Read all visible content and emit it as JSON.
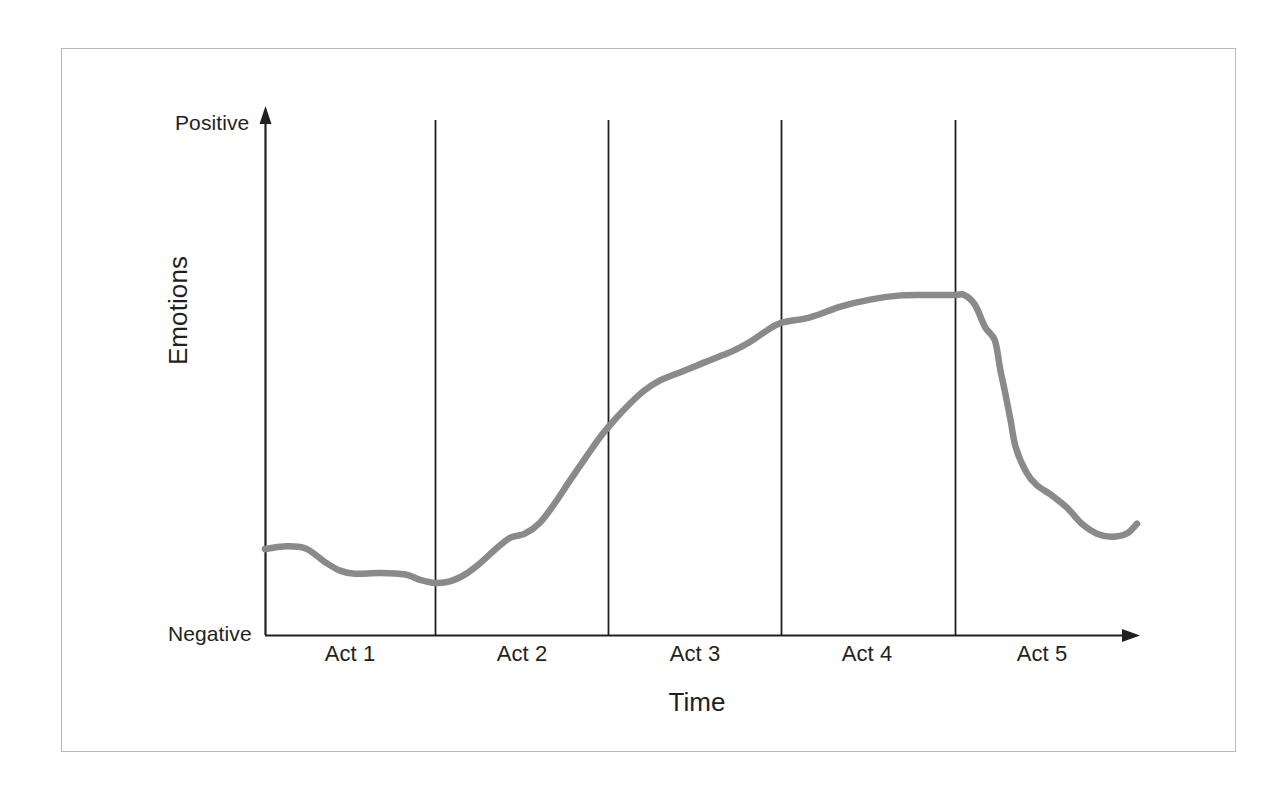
{
  "figure": {
    "background_color": "#ffffff",
    "border_color": "#b9b9b9",
    "axis_color": "#231f20",
    "curve_color": "#8a8a8a"
  },
  "axes": {
    "y_top_label": "Positive",
    "y_bottom_label": "Negative",
    "y_axis_title": "Emotions",
    "x_axis_title": "Time"
  },
  "acts": [
    {
      "label": "Act 1"
    },
    {
      "label": "Act 2"
    },
    {
      "label": "Act 3"
    },
    {
      "label": "Act 4"
    },
    {
      "label": "Act 5"
    }
  ],
  "chart_data": {
    "type": "line",
    "title": "",
    "xlabel": "Time",
    "ylabel": "Emotions",
    "xlim": [
      0,
      100
    ],
    "ylim": [
      0,
      100
    ],
    "grid": false,
    "legend": "none",
    "y_tick_labels": [
      "Negative",
      "Positive"
    ],
    "x_tick_labels": [
      "Act 1",
      "Act 2",
      "Act 3",
      "Act 4",
      "Act 5"
    ],
    "act_boundaries_x": [
      19.5,
      39.3,
      59.1,
      79.1
    ],
    "annotations": [
      "Emotional arc rises steeply through Act 2, peaks and plateaus across Act 3 into Act 4, then falls sharply at the end of Act 4 into Act 5"
    ],
    "series": [
      {
        "name": "Emotional arc",
        "color": "#8a8a8a",
        "x": [
          0.0,
          2.1,
          4.6,
          6.9,
          8.6,
          10.3,
          13.2,
          16.1,
          17.8,
          19.5,
          21.2,
          23.0,
          24.7,
          26.4,
          28.1,
          29.8,
          31.5,
          33.2,
          35.0,
          36.7,
          38.4,
          40.1,
          41.8,
          43.5,
          45.3,
          47.0,
          48.7,
          50.4,
          52.1,
          53.8,
          55.6,
          57.3,
          59.1,
          62.5,
          66.0,
          69.4,
          72.9,
          76.3,
          79.1,
          80.2,
          81.4,
          82.6,
          83.7,
          84.3,
          84.9,
          85.5,
          86.1,
          87.3,
          88.5,
          90.2,
          92.0,
          93.7,
          95.4,
          97.1,
          98.8,
          100.0
        ],
        "y": [
          16.6,
          17.3,
          16.8,
          13.2,
          11.0,
          10.2,
          10.4,
          10.0,
          8.6,
          7.8,
          8.2,
          10.1,
          13.0,
          16.5,
          19.5,
          20.6,
          23.4,
          28.4,
          34.5,
          40.1,
          45.6,
          50.2,
          54.3,
          57.8,
          60.4,
          62.0,
          63.5,
          65.1,
          66.6,
          68.2,
          70.4,
          73.0,
          75.3,
          76.8,
          79.6,
          81.4,
          82.5,
          82.6,
          82.6,
          82.6,
          80.1,
          74.2,
          70.8,
          63.5,
          57.0,
          50.1,
          43.0,
          36.6,
          33.2,
          30.6,
          27.3,
          23.1,
          20.6,
          19.8,
          20.6,
          23.2
        ]
      }
    ]
  }
}
